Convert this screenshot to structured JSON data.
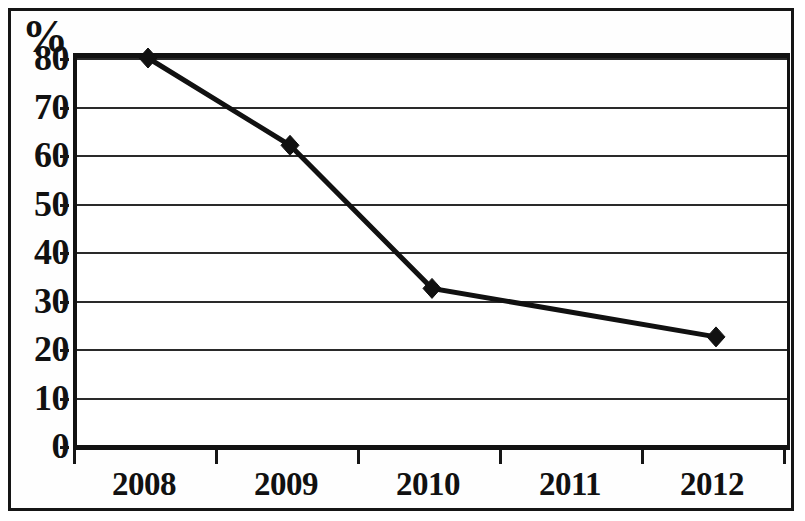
{
  "chart_data": {
    "type": "line",
    "title": "",
    "subtitle": "",
    "xlabel": "",
    "ylabel": "%",
    "categories": [
      "2008",
      "2009",
      "2010",
      "2011",
      "2012"
    ],
    "series": [
      {
        "name": "",
        "values": [
          80,
          62,
          32.5,
          null,
          22.5
        ],
        "marker": "diamond",
        "color": "#111111"
      }
    ],
    "ylim": [
      0,
      80
    ],
    "ytick_labels": [
      "0",
      "10",
      "20",
      "30",
      "40",
      "50",
      "60",
      "70",
      "80"
    ],
    "ytick_values": [
      0,
      10,
      20,
      30,
      40,
      50,
      60,
      70,
      80
    ],
    "ytick_step": 10,
    "grid": {
      "horizontal": true,
      "vertical": false
    },
    "legend": {
      "visible": false,
      "position": "none"
    },
    "annotations": [],
    "axis_unit_label": "%",
    "frame": {
      "outer_border": true,
      "plot_border": true,
      "border_color": "#121212"
    }
  }
}
